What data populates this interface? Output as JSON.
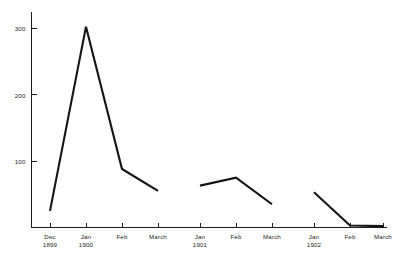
{
  "chart_data": {
    "type": "line",
    "title": "",
    "xlabel": "",
    "ylabel": "",
    "ylim": [
      0,
      330
    ],
    "yticks": [
      100,
      200,
      300
    ],
    "ytick_labels": [
      "100",
      "200",
      "300"
    ],
    "grid": false,
    "legend": "none",
    "background_color": "#ffffff",
    "line_color": "#141414",
    "axis_color": "#1d1d1d",
    "x_categories": [
      {
        "month": "Dec",
        "year": "1899"
      },
      {
        "month": "Jan",
        "year": "1900"
      },
      {
        "month": "Feb",
        "year": ""
      },
      {
        "month": "March",
        "year": ""
      },
      {
        "month": "Jan",
        "year": "1901"
      },
      {
        "month": "Feb",
        "year": ""
      },
      {
        "month": "March",
        "year": ""
      },
      {
        "month": "Jan",
        "year": "1902"
      },
      {
        "month": "Feb",
        "year": ""
      },
      {
        "month": "March",
        "year": ""
      }
    ],
    "series": [
      {
        "name": "1899-1900 season",
        "points": [
          {
            "x": "Dec 1899",
            "y": 25
          },
          {
            "x": "Jan 1900",
            "y": 302
          },
          {
            "x": "Feb 1900",
            "y": 88
          },
          {
            "x": "March 1900",
            "y": 55
          }
        ]
      },
      {
        "name": "1901 season",
        "points": [
          {
            "x": "Jan 1901",
            "y": 63
          },
          {
            "x": "Feb 1901",
            "y": 75
          },
          {
            "x": "March 1901",
            "y": 35
          }
        ]
      },
      {
        "name": "1902 season",
        "points": [
          {
            "x": "Jan 1902",
            "y": 53
          },
          {
            "x": "Feb 1902",
            "y": 3
          },
          {
            "x": "March 1902",
            "y": 2
          }
        ]
      }
    ]
  }
}
